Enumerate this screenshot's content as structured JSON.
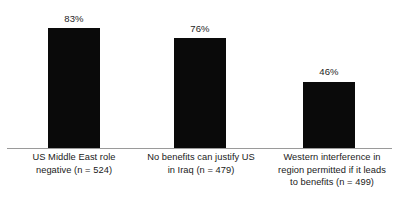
{
  "chart_data": {
    "type": "bar",
    "title": "",
    "subtitle": "",
    "xlabel": "",
    "ylabel": "",
    "ylim": [
      0,
      100
    ],
    "grid": false,
    "legend": false,
    "legend_position": "none",
    "bar_color": "#0a0a0a",
    "background_color": "#ffffff",
    "axis_color": "#9a9a9a",
    "categories": [
      "US Middle East role negative (n = 524)",
      "No benefits can justify US in Iraq (n = 479)",
      "Western interference in region permitted if it leads to benefits (n = 499)"
    ],
    "values": [
      83,
      76,
      46
    ],
    "data_labels": [
      "83%",
      "76%",
      "46%"
    ],
    "sample_sizes": [
      524,
      479,
      499
    ],
    "category_lines": [
      [
        "US Middle East role",
        "negative (n = 524)"
      ],
      [
        "No benefits can justify US",
        "in Iraq (n = 479)"
      ],
      [
        "Western interference in",
        "region permitted if it leads",
        "to benefits (n = 499)"
      ]
    ]
  }
}
